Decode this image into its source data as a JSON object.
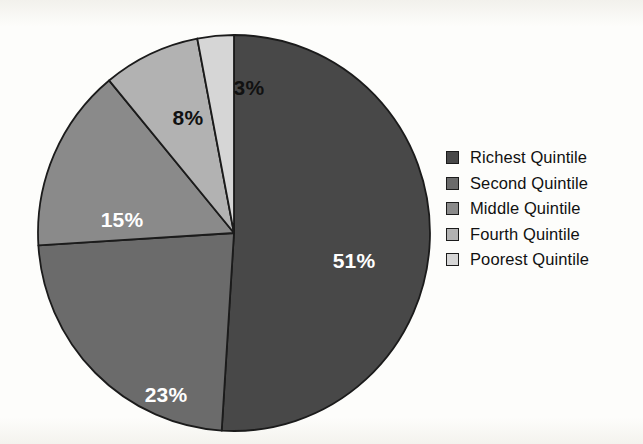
{
  "chart_data": {
    "type": "pie",
    "title": "",
    "subtitle": "",
    "xlabel": "",
    "ylabel": "",
    "grid": false,
    "legend_position": "right",
    "start_angle_deg": 0,
    "direction": "clockwise",
    "units": "percent",
    "categories": [
      "Richest Quintile",
      "Second Quintile",
      "Middle Quintile",
      "Fourth Quintile",
      "Poorest Quintile"
    ],
    "values": [
      51,
      23,
      15,
      8,
      3
    ],
    "data_labels": [
      "51%",
      "23%",
      "15%",
      "8%",
      "3%"
    ],
    "colors": [
      "#484848",
      "#6b6b6b",
      "#8a8a8a",
      "#b2b2b2",
      "#d6d6d6"
    ],
    "label_colors": [
      "#ffffff",
      "#ffffff",
      "#ffffff",
      "#111111",
      "#111111"
    ],
    "slices": [
      {
        "label": "Richest Quintile",
        "value": 51,
        "data_label": "51%",
        "color": "#484848",
        "label_color": "#ffffff",
        "start_deg": 0,
        "end_deg": 183.6,
        "label_x": 318,
        "label_y": 228
      },
      {
        "label": "Second Quintile",
        "value": 23,
        "data_label": "23%",
        "color": "#6b6b6b",
        "label_color": "#ffffff",
        "start_deg": 183.6,
        "end_deg": 266.4,
        "label_x": 130,
        "label_y": 362
      },
      {
        "label": "Middle Quintile",
        "value": 15,
        "data_label": "15%",
        "color": "#8a8a8a",
        "label_color": "#ffffff",
        "start_deg": 266.4,
        "end_deg": 320.4,
        "label_x": 86,
        "label_y": 187
      },
      {
        "label": "Fourth Quintile",
        "value": 8,
        "data_label": "8%",
        "color": "#b2b2b2",
        "label_color": "#111111",
        "start_deg": 320.4,
        "end_deg": 349.2,
        "label_x": 152,
        "label_y": 85
      },
      {
        "label": "Poorest Quintile",
        "value": 3,
        "data_label": "3%",
        "color": "#d6d6d6",
        "label_color": "#111111",
        "start_deg": 349.2,
        "end_deg": 360,
        "label_x": 213,
        "label_y": 55
      }
    ]
  },
  "legend": {
    "items": [
      {
        "label": "Richest Quintile",
        "color": "#484848"
      },
      {
        "label": "Second Quintile",
        "color": "#6b6b6b"
      },
      {
        "label": "Middle Quintile",
        "color": "#8a8a8a"
      },
      {
        "label": "Fourth Quintile",
        "color": "#b2b2b2"
      },
      {
        "label": "Poorest Quintile",
        "color": "#d6d6d6"
      }
    ]
  },
  "page": {
    "background_color": "#fdfdfb",
    "outline_color": "#1b1b1b"
  }
}
